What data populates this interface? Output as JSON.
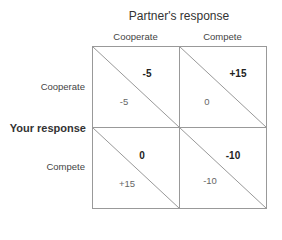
{
  "diagram": {
    "type": "payoff-matrix",
    "title": "Partner's  response",
    "row_axis_label": "Your response",
    "columns": [
      "Cooperate",
      "Compete"
    ],
    "rows": [
      "Cooperate",
      "Compete"
    ],
    "cells": [
      [
        {
          "partner_payoff": "-5",
          "your_payoff": "-5"
        },
        {
          "partner_payoff": "+15",
          "your_payoff": "0"
        }
      ],
      [
        {
          "partner_payoff": "0",
          "your_payoff": "+15"
        },
        {
          "partner_payoff": "-10",
          "your_payoff": "-10"
        }
      ]
    ],
    "colors": {
      "grid_line": "#999999",
      "text": "#333333"
    }
  }
}
